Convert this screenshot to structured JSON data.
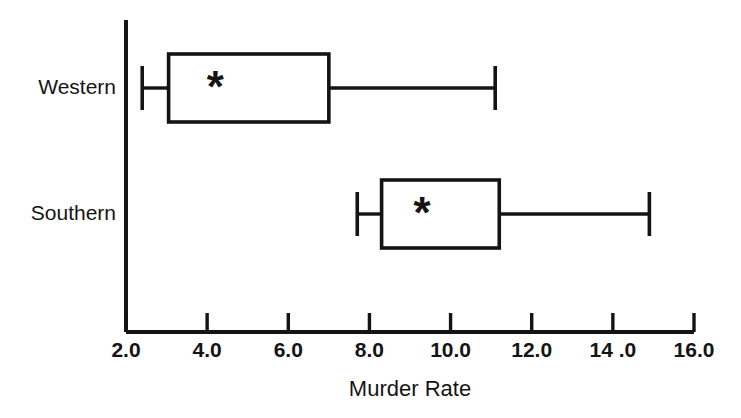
{
  "chart_data": {
    "type": "box",
    "title": "",
    "xlabel": "Murder Rate",
    "ylabel": "",
    "xlim": [
      2.0,
      16.0
    ],
    "grid": false,
    "legend": "none",
    "orientation": "horizontal",
    "marker_symbol": "*",
    "marker_meaning": "mean",
    "xtick_values": [
      2.0,
      4.0,
      6.0,
      8.0,
      10.0,
      12.0,
      14.0,
      16.0
    ],
    "xtick_labels": [
      "2.0",
      "4.0",
      "6.0",
      "8.0",
      "10.0",
      "12.0",
      "14 .0",
      "16.0"
    ],
    "categories": [
      "Western",
      "Southern"
    ],
    "boxes": [
      {
        "category": "Western",
        "whisker_low": 2.4,
        "q1": 3.05,
        "q3": 7.0,
        "whisker_high": 11.1,
        "mean": 4.2,
        "median_line": false
      },
      {
        "category": "Southern",
        "whisker_low": 7.7,
        "q1": 8.3,
        "q3": 11.2,
        "whisker_high": 14.9,
        "mean": 9.3,
        "median_line": false
      }
    ]
  },
  "colors": {
    "ink": "#141414",
    "background": "#ffffff"
  }
}
